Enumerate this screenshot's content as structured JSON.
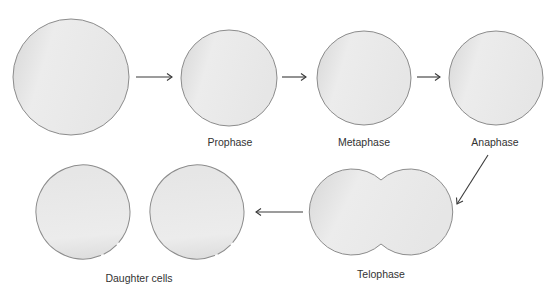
{
  "diagram": {
    "colors": {
      "cell_fill_light": "#f4f4f4",
      "cell_fill_dark": "#d2d2d2",
      "cell_outline": "#8c8c8c",
      "arrow": "#3a3a3a",
      "label_text": "#333333",
      "background": "#ffffff"
    },
    "stages": [
      {
        "id": "parent-cell",
        "label": "",
        "shape": "circle",
        "cx": 71,
        "cy": 77,
        "r": 58
      },
      {
        "id": "prophase",
        "label": "Prophase",
        "shape": "circle",
        "cx": 229,
        "cy": 78,
        "r": 48,
        "label_x": 230,
        "label_y": 146
      },
      {
        "id": "metaphase",
        "label": "Metaphase",
        "shape": "circle",
        "cx": 364,
        "cy": 78,
        "r": 47,
        "label_x": 364,
        "label_y": 146
      },
      {
        "id": "anaphase",
        "label": "Anaphase",
        "shape": "circle",
        "cx": 496,
        "cy": 78,
        "r": 47,
        "label_x": 495,
        "label_y": 146
      },
      {
        "id": "telophase",
        "label": "Telophase",
        "shape": "pinched-double-circle",
        "left_cx": 352,
        "right_cx": 410,
        "cy": 212,
        "r": 43,
        "label_x": 381,
        "label_y": 278
      },
      {
        "id": "daughter-cells",
        "label": "Daughter cells",
        "shape": "two-circles",
        "cells": [
          {
            "cx": 83,
            "cy": 212,
            "r": 47
          },
          {
            "cx": 197,
            "cy": 212,
            "r": 47
          }
        ],
        "label_x": 139,
        "label_y": 282
      }
    ],
    "arrows": [
      {
        "from": "parent-cell",
        "to": "prophase",
        "direction": "right",
        "x1": 136,
        "y1": 77,
        "x2": 172,
        "y2": 77
      },
      {
        "from": "prophase",
        "to": "metaphase",
        "direction": "right",
        "x1": 282,
        "y1": 77,
        "x2": 306,
        "y2": 77
      },
      {
        "from": "metaphase",
        "to": "anaphase",
        "direction": "right",
        "x1": 417,
        "y1": 77,
        "x2": 440,
        "y2": 77
      },
      {
        "from": "anaphase",
        "to": "telophase",
        "direction": "down-left",
        "x1": 488,
        "y1": 155,
        "x2": 457,
        "y2": 204
      },
      {
        "from": "telophase",
        "to": "daughter-cells",
        "direction": "left",
        "x1": 303,
        "y1": 212,
        "x2": 256,
        "y2": 212
      }
    ],
    "labels": {
      "prophase": "Prophase",
      "metaphase": "Metaphase",
      "anaphase": "Anaphase",
      "telophase": "Telophase",
      "daughter_cells": "Daughter cells"
    }
  }
}
